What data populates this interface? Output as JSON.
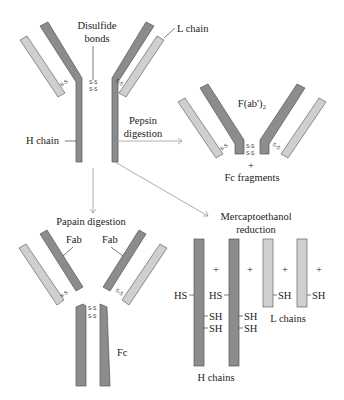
{
  "colors": {
    "heavy_chain": "#8c8c8c",
    "light_chain": "#cfcfcf",
    "arrow": "#999999",
    "text": "#222222"
  },
  "intact_antibody": {
    "disulfide_label_1": "Disulfide",
    "disulfide_label_2": "bonds",
    "l_chain_label": "L chain",
    "h_chain_label": "H chain",
    "bond_label": "S-S"
  },
  "pepsin": {
    "label_1": "Pepsin",
    "label_2": "digestion",
    "fragment_label": "F(ab')₂",
    "plus": "+",
    "fc_label": "Fc  fragments"
  },
  "papain": {
    "label": "Papain digestion",
    "fab_left": "Fab",
    "fab_right": "Fab",
    "fc_label": "Fc"
  },
  "mercaptoethanol": {
    "label_1": "Mercaptoethanol",
    "label_2": "reduction",
    "plus": "+",
    "hs": "HS",
    "sh": "SH",
    "h_chains_label": "H chains",
    "l_chains_label": "L chains"
  }
}
